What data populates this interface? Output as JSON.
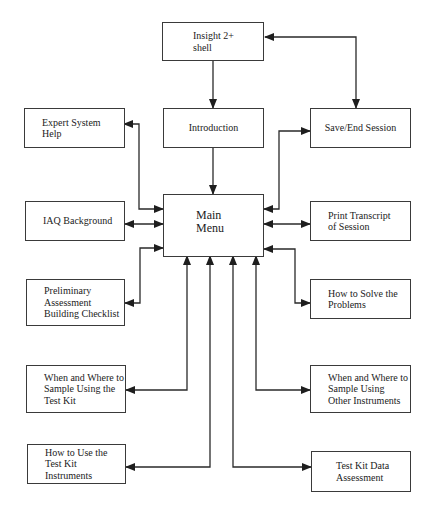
{
  "diagram": {
    "type": "flowchart",
    "title": "",
    "nodes": {
      "shell": {
        "label": "Insight 2+\nshell"
      },
      "introduction": {
        "label": "Introduction"
      },
      "save_end": {
        "label": "Save/End Session"
      },
      "expert_help": {
        "label": "Expert System\nHelp"
      },
      "main_menu": {
        "label": "Main\nMenu"
      },
      "iaq_background": {
        "label": "IAQ Background"
      },
      "print_transcript": {
        "label": "Print  Transcript\nof Session"
      },
      "preliminary": {
        "label": "Preliminary\nAssessment\nBuilding Checklist"
      },
      "how_to_solve": {
        "label": "How to Solve the\nProblems"
      },
      "when_where_testkit": {
        "label": "When and Where to\nSample Using the\nTest Kit"
      },
      "when_where_other": {
        "label": "When and Where to\nSample Using\nOther Instruments"
      },
      "how_to_use": {
        "label": "How to Use the\nTest Kit\nInstruments"
      },
      "testkit_data": {
        "label": "Test Kit Data\nAssessment"
      }
    },
    "edges": [
      {
        "from": "shell",
        "to": "introduction",
        "direction": "one-way"
      },
      {
        "from": "shell",
        "to": "save_end",
        "direction": "two-way"
      },
      {
        "from": "introduction",
        "to": "main_menu",
        "direction": "one-way"
      },
      {
        "from": "main_menu",
        "to": "expert_help",
        "direction": "two-way"
      },
      {
        "from": "main_menu",
        "to": "save_end",
        "direction": "two-way"
      },
      {
        "from": "main_menu",
        "to": "iaq_background",
        "direction": "two-way"
      },
      {
        "from": "main_menu",
        "to": "print_transcript",
        "direction": "two-way"
      },
      {
        "from": "main_menu",
        "to": "preliminary",
        "direction": "two-way"
      },
      {
        "from": "main_menu",
        "to": "how_to_solve",
        "direction": "two-way"
      },
      {
        "from": "main_menu",
        "to": "when_where_testkit",
        "direction": "two-way"
      },
      {
        "from": "main_menu",
        "to": "how_to_use",
        "direction": "two-way"
      },
      {
        "from": "main_menu",
        "to": "testkit_data",
        "direction": "two-way"
      },
      {
        "from": "main_menu",
        "to": "when_where_other",
        "direction": "two-way"
      }
    ],
    "colors": {
      "line": "#2a2a2a",
      "box_border": "#3a3a3a",
      "background": "#ffffff"
    }
  }
}
